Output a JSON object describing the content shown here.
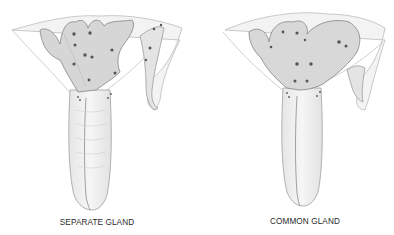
{
  "figures": [
    {
      "id": "separate",
      "caption": "SEPARATE GLAND",
      "style": "pencil anatomical illustration",
      "colors": {
        "outline": "#9a9a9a",
        "shade": "#c8c8c8",
        "dots": "#555555"
      }
    },
    {
      "id": "common",
      "caption": "COMMON GLAND",
      "style": "pencil anatomical illustration",
      "colors": {
        "outline": "#9a9a9a",
        "shade": "#c8c8c8",
        "dots": "#555555"
      }
    }
  ]
}
